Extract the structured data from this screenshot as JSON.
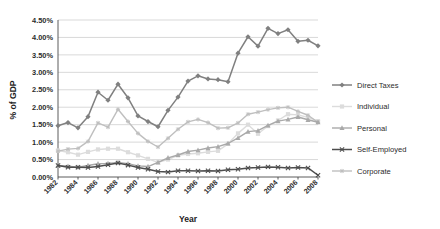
{
  "chart_data": {
    "type": "line",
    "title": "",
    "xlabel": "Year",
    "ylabel": "% of GDP",
    "grid": true,
    "legend_position": "right",
    "xlim": [
      1982,
      2008
    ],
    "ylim": [
      0.0,
      4.5
    ],
    "ytick_labels": [
      "0.00%",
      "0.50%",
      "1.00%",
      "1.50%",
      "2.00%",
      "2.50%",
      "3.00%",
      "3.50%",
      "4.00%",
      "4.50%"
    ],
    "ytick_values": [
      0.0,
      0.5,
      1.0,
      1.5,
      2.0,
      2.5,
      3.0,
      3.5,
      4.0,
      4.5
    ],
    "x": [
      1982,
      1983,
      1984,
      1985,
      1986,
      1987,
      1988,
      1989,
      1990,
      1991,
      1992,
      1993,
      1994,
      1995,
      1996,
      1997,
      1998,
      1999,
      2000,
      2001,
      2002,
      2003,
      2004,
      2005,
      2006,
      2007,
      2008
    ],
    "xtick_labels": [
      "1982",
      "1984",
      "1986",
      "1988",
      "1990",
      "1992",
      "1994",
      "1996",
      "1998",
      "2000",
      "2002",
      "2004",
      "2006",
      "2008"
    ],
    "series": [
      {
        "name": "Direct Taxes",
        "color": "#808080",
        "marker": "diamond",
        "width": 1.5,
        "values": [
          1.47,
          1.56,
          1.41,
          1.73,
          2.43,
          2.2,
          2.66,
          2.27,
          1.75,
          1.59,
          1.44,
          1.91,
          2.29,
          2.75,
          2.9,
          2.81,
          2.79,
          2.73,
          3.55,
          4.02,
          3.75,
          4.26,
          4.11,
          4.22,
          3.89,
          3.92,
          3.76
        ]
      },
      {
        "name": "Individual",
        "color": "#dcdcdc",
        "marker": "square",
        "width": 1.4,
        "values": [
          0.76,
          0.71,
          0.64,
          0.72,
          0.79,
          0.81,
          0.81,
          0.71,
          0.62,
          0.52,
          0.42,
          0.5,
          0.62,
          0.66,
          0.68,
          0.72,
          0.75,
          0.95,
          1.25,
          1.5,
          1.24,
          1.46,
          1.62,
          1.8,
          1.78,
          1.71,
          1.6
        ]
      },
      {
        "name": "Personal",
        "color": "#a9a9a9",
        "marker": "triangle",
        "width": 1.4,
        "values": [
          0.33,
          0.31,
          0.28,
          0.33,
          0.38,
          0.39,
          0.42,
          0.38,
          0.32,
          0.3,
          0.42,
          0.55,
          0.63,
          0.73,
          0.77,
          0.83,
          0.87,
          0.96,
          1.12,
          1.3,
          1.33,
          1.48,
          1.6,
          1.65,
          1.72,
          1.64,
          1.57
        ]
      },
      {
        "name": "Self-Employed",
        "color": "#4d4d4d",
        "marker": "x",
        "width": 1.5,
        "values": [
          0.33,
          0.28,
          0.28,
          0.27,
          0.3,
          0.35,
          0.4,
          0.34,
          0.27,
          0.22,
          0.16,
          0.14,
          0.18,
          0.18,
          0.17,
          0.18,
          0.17,
          0.21,
          0.22,
          0.26,
          0.27,
          0.29,
          0.28,
          0.26,
          0.27,
          0.26,
          0.05
        ]
      },
      {
        "name": "Corporate",
        "color": "#bfbfbf",
        "marker": "asterisk",
        "width": 1.4,
        "values": [
          0.74,
          0.8,
          0.82,
          1.02,
          1.55,
          1.43,
          1.94,
          1.59,
          1.25,
          1.02,
          0.86,
          1.11,
          1.37,
          1.58,
          1.65,
          1.56,
          1.4,
          1.41,
          1.55,
          1.8,
          1.86,
          1.93,
          1.98,
          2.0,
          1.88,
          1.77,
          1.57
        ]
      }
    ]
  },
  "axes": {
    "ylabel": "% of GDP",
    "xlabel": "Year"
  },
  "legend": {
    "items": [
      {
        "label": "Direct Taxes"
      },
      {
        "label": "Individual"
      },
      {
        "label": "Personal"
      },
      {
        "label": "Self-Employed"
      },
      {
        "label": "Corporate"
      }
    ]
  }
}
